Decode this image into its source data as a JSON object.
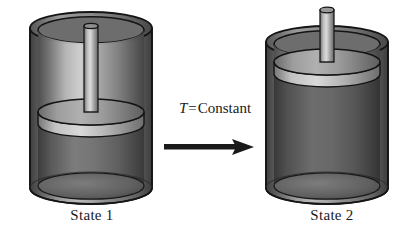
{
  "figure": {
    "background_color": "#ffffff"
  },
  "annotation": {
    "symbol": "T",
    "equals": "=",
    "value": "Constant",
    "full_text": "T = Constant",
    "arrow_direction": "right",
    "arrow_color": "#1a1a1a"
  },
  "states": [
    {
      "id": "state-1",
      "label": "State 1",
      "piston_position": "low",
      "rod_above_cylinder": false,
      "gas_region": "large-lower",
      "colors": {
        "wall_dark": "#4a4a4a",
        "wall_light": "#d8d8d8",
        "gas": "#6e6e6e",
        "piston": "#bfbfbf",
        "rod": "#c9c9c9",
        "outline": "#1c1c1c"
      }
    },
    {
      "id": "state-2",
      "label": "State 2",
      "piston_position": "high",
      "rod_above_cylinder": true,
      "gas_region": "expanded",
      "colors": {
        "wall_dark": "#4a4a4a",
        "wall_light": "#d8d8d8",
        "gas": "#5e5e5e",
        "piston": "#c4c4c4",
        "rod": "#c9c9c9",
        "outline": "#1c1c1c"
      }
    }
  ]
}
